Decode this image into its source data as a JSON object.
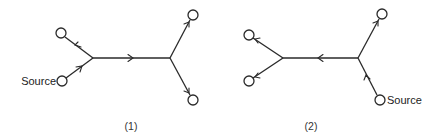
{
  "diagrams": [
    {
      "caption": "(1)",
      "source_label": "Source",
      "description": "Flow from source into left junction, splitting to upper-left sink and through central edge to right junction, which splits to upper-right and lower-right sinks"
    },
    {
      "caption": "(2)",
      "source_label": "Source",
      "description": "Flow from lower-right source into right junction, splitting to upper-right sink and through central edge leftward to left junction, which splits to upper-left and lower-left sinks"
    }
  ],
  "colors": {
    "stroke": "#2a2a2a",
    "background": "#ffffff"
  }
}
